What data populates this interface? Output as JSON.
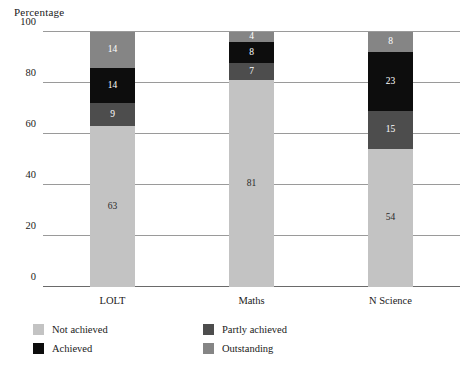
{
  "chart_data": {
    "type": "bar",
    "subtype": "stacked-100-percent",
    "title": "",
    "subtitle": "",
    "xlabel": "",
    "ylabel": "Percentage",
    "ylim": [
      0,
      100
    ],
    "yticks": [
      0,
      20,
      40,
      60,
      80,
      100
    ],
    "grid": true,
    "legend_position": "bottom-left",
    "categories": [
      "LOLT",
      "Maths",
      "N Science"
    ],
    "series": [
      {
        "name": "Not achieved",
        "color": "#c3c3c3",
        "label_color": "#2a2a2a",
        "values": [
          63,
          81,
          54
        ]
      },
      {
        "name": "Partly achieved",
        "color": "#4d4d4d",
        "label_color": "#ffffff",
        "values": [
          9,
          7,
          15
        ]
      },
      {
        "name": "Achieved",
        "color": "#0d0d0d",
        "label_color": "#ffffff",
        "values": [
          14,
          8,
          23
        ]
      },
      {
        "name": "Outstanding",
        "color": "#858585",
        "label_color": "#ffffff",
        "values": [
          14,
          4,
          8
        ]
      }
    ],
    "legend_order": [
      "Not achieved",
      "Partly achieved",
      "Achieved",
      "Outstanding"
    ],
    "stack_order_bottom_to_top": [
      "Not achieved",
      "Partly achieved",
      "Achieved",
      "Outstanding"
    ],
    "axis_color": "#9a9a9a",
    "background": "#ffffff"
  }
}
